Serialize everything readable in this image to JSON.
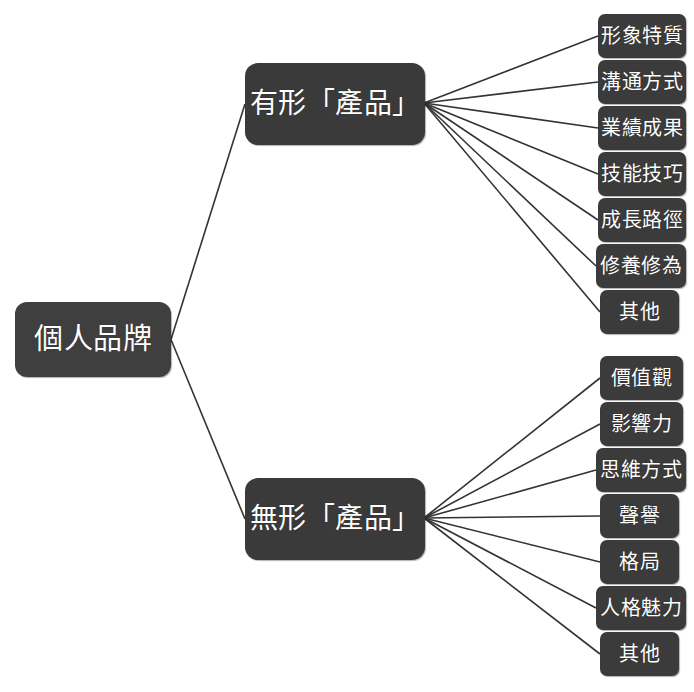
{
  "diagram": {
    "type": "mind-map",
    "title": "個人品牌",
    "background_color": "#ffffff",
    "node_color": "#3c3c3c",
    "node_text_color": "#ffffff",
    "edge_color": "#333333",
    "root": {
      "label": "個人品牌",
      "x": 15,
      "y": 302,
      "w": 156,
      "h": 75
    },
    "branches": [
      {
        "label": "有形「產品」",
        "x": 245,
        "y": 63,
        "w": 180,
        "h": 82,
        "hub_x": 424,
        "hub_y": 103,
        "children": [
          {
            "label": "形象特質",
            "x": 598,
            "y": 14,
            "w": 88,
            "h": 44
          },
          {
            "label": "溝通方式",
            "x": 598,
            "y": 60,
            "w": 88,
            "h": 44
          },
          {
            "label": "業績成果",
            "x": 598,
            "y": 106,
            "w": 88,
            "h": 44
          },
          {
            "label": "技能技巧",
            "x": 598,
            "y": 152,
            "w": 88,
            "h": 44
          },
          {
            "label": "成長路徑",
            "x": 598,
            "y": 198,
            "w": 88,
            "h": 44
          },
          {
            "label": "修養修為",
            "x": 596,
            "y": 244,
            "w": 90,
            "h": 44
          },
          {
            "label": "其他",
            "x": 600,
            "y": 290,
            "w": 79,
            "h": 44
          }
        ]
      },
      {
        "label": "無形「產品」",
        "x": 245,
        "y": 478,
        "w": 180,
        "h": 82,
        "hub_x": 424,
        "hub_y": 518,
        "children": [
          {
            "label": "價值觀",
            "x": 600,
            "y": 356,
            "w": 83,
            "h": 44
          },
          {
            "label": "影響力",
            "x": 600,
            "y": 402,
            "w": 83,
            "h": 44
          },
          {
            "label": "思維方式",
            "x": 596,
            "y": 448,
            "w": 90,
            "h": 44
          },
          {
            "label": "聲譽",
            "x": 600,
            "y": 494,
            "w": 79,
            "h": 44
          },
          {
            "label": "格局",
            "x": 600,
            "y": 540,
            "w": 79,
            "h": 44
          },
          {
            "label": "人格魅力",
            "x": 596,
            "y": 586,
            "w": 90,
            "h": 44
          },
          {
            "label": "其他",
            "x": 600,
            "y": 632,
            "w": 79,
            "h": 44
          }
        ]
      }
    ]
  }
}
